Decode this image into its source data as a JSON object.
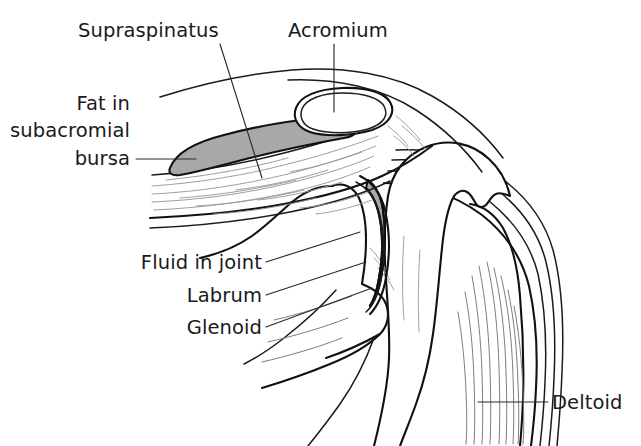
{
  "figure": {
    "background_color": "#ffffff",
    "ink_color": "#111111",
    "shade_color": "#a8a8a8",
    "width": 641,
    "height": 446
  },
  "labels": {
    "supraspinatus": "Supraspinatus",
    "acromium": "Acromium",
    "fat_line1": "Fat in",
    "fat_line2": "subacromial",
    "fat_line3": "bursa",
    "fluid_in_joint": "Fluid in joint",
    "labrum": "Labrum",
    "glenoid": "Glenoid",
    "deltoid": "Deltoid"
  },
  "structures": [
    {
      "name": "supraspinatus",
      "kind": "muscle",
      "shaded": false
    },
    {
      "name": "acromium",
      "kind": "bone",
      "shaded": false
    },
    {
      "name": "subacromial-bursa-fat",
      "kind": "fat",
      "shaded": true,
      "color": "#a8a8a8"
    },
    {
      "name": "fluid-in-joint",
      "kind": "fluid",
      "shaded": false
    },
    {
      "name": "labrum",
      "kind": "cartilage",
      "shaded": true,
      "color": "#a8a8a8"
    },
    {
      "name": "glenoid",
      "kind": "bone",
      "shaded": false
    },
    {
      "name": "humeral-head",
      "kind": "bone",
      "shaded": false
    },
    {
      "name": "deltoid",
      "kind": "muscle",
      "shaded": false
    }
  ]
}
